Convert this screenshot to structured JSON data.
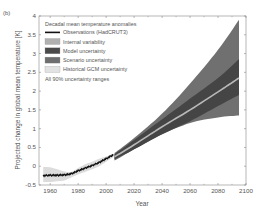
{
  "panel_label": "(b)",
  "chart_data": {
    "type": "area",
    "title": "",
    "xlabel": "Year",
    "ylabel": "Projected change in global mean temperature [K]",
    "xlim": [
      1952,
      2100
    ],
    "ylim": [
      -0.5,
      4
    ],
    "xticks": [
      1960,
      1980,
      2000,
      2020,
      2040,
      2060,
      2080,
      2100
    ],
    "yticks": [
      -0.5,
      0,
      0.5,
      1,
      1.5,
      2,
      2.5,
      3,
      3.5,
      4
    ],
    "ytick_labels": [
      "-0.5",
      "0",
      "0.5",
      "1",
      "1.5",
      "2",
      "2.5",
      "3",
      "3.5",
      "4"
    ],
    "grid": false,
    "legend_position": "upper left",
    "legend": {
      "title": "Decadal mean temperature anomalies",
      "entries": [
        {
          "label": "Observations (HadCRUT3)",
          "kind": "line",
          "color": "#111111"
        },
        {
          "label": "Internal variability",
          "kind": "patch",
          "color": "#b0b0b0"
        },
        {
          "label": "Model uncertainty",
          "kind": "patch",
          "color": "#4a4a4a"
        },
        {
          "label": "Scenario uncertainty",
          "kind": "patch",
          "color": "#6e6e6e"
        },
        {
          "label": "Historical GCM uncertainty",
          "kind": "patch",
          "color": "#e2e2e2"
        }
      ],
      "note": "All 90% uncertainty ranges"
    },
    "series": [
      {
        "name": "Observations (HadCRUT3)",
        "x": [
          1955,
          1960,
          1965,
          1970,
          1975,
          1980,
          1985,
          1990,
          1995,
          2000,
          2005
        ],
        "values": [
          -0.25,
          -0.24,
          -0.24,
          -0.23,
          -0.2,
          -0.12,
          -0.05,
          0.02,
          0.1,
          0.2,
          0.3
        ]
      },
      {
        "name": "Historical GCM uncertainty",
        "x": [
          1955,
          1960,
          1965,
          1970,
          1975,
          1980,
          1985,
          1990,
          1995,
          2000,
          2005
        ],
        "upper": [
          -0.02,
          -0.03,
          -0.08,
          -0.14,
          -0.15,
          -0.05,
          0.05,
          0.12,
          0.2,
          0.26,
          0.34
        ],
        "lower": [
          -0.42,
          -0.42,
          -0.4,
          -0.38,
          -0.3,
          -0.22,
          -0.15,
          -0.08,
          0.0,
          0.12,
          0.24
        ]
      },
      {
        "name": "Scenario uncertainty",
        "x": [
          2006,
          2020,
          2040,
          2060,
          2080,
          2095
        ],
        "upper": [
          0.35,
          0.75,
          1.4,
          2.2,
          3.1,
          3.9
        ],
        "lower": [
          0.15,
          0.45,
          0.85,
          1.15,
          1.3,
          1.35
        ]
      },
      {
        "name": "Model uncertainty",
        "x": [
          2006,
          2020,
          2040,
          2060,
          2080,
          2095
        ],
        "upper": [
          0.32,
          0.7,
          1.25,
          1.8,
          2.35,
          2.85
        ],
        "lower": [
          0.18,
          0.45,
          0.85,
          1.2,
          1.6,
          1.9
        ]
      },
      {
        "name": "Central projection",
        "x": [
          2006,
          2020,
          2040,
          2060,
          2080,
          2095
        ],
        "values": [
          0.25,
          0.57,
          1.05,
          1.5,
          1.98,
          2.35
        ]
      }
    ]
  },
  "colors": {
    "scenario": "#707070",
    "model": "#454545",
    "central": "#b8b8b8",
    "historical": "#dcdcdc",
    "observations": "#111111",
    "axis": "#888888"
  }
}
